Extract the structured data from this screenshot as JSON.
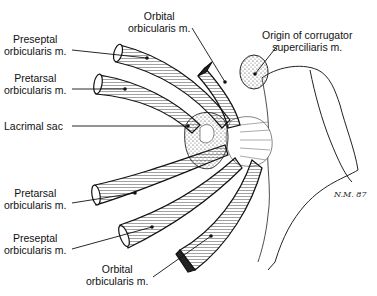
{
  "diagram": {
    "labels": {
      "orbital_top": [
        "Orbital",
        "orbicularis m."
      ],
      "preseptal_top": [
        "Preseptal",
        "orbicularis m."
      ],
      "pretarsal_top": [
        "Pretarsal",
        "orbicularis m."
      ],
      "lacrimal_sac": "Lacrimal sac",
      "corrugator": [
        "Origin of corrugator",
        "superciliaris m."
      ],
      "pretarsal_bottom": [
        "Pretarsal",
        "orbicularis m."
      ],
      "preseptal_bottom": [
        "Preseptal",
        "orbicularis m."
      ],
      "orbital_bottom": [
        "Orbital",
        "orbicularis m."
      ]
    },
    "signature": "N.M. 87"
  }
}
